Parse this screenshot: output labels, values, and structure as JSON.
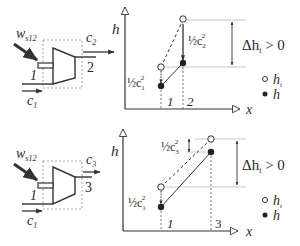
{
  "top": {
    "turbine": {
      "work_label": "w",
      "work_sub": "s12",
      "inlet_label": "1",
      "outlet_label": "2",
      "inlet_velocity": "c",
      "inlet_velocity_sub": "1",
      "outlet_velocity": "c",
      "outlet_velocity_sub": "2"
    },
    "chart": {
      "y_axis_label": "h",
      "x_axis_label": "x",
      "tick_1": "1",
      "tick_2": "2",
      "ke1_label": "½c",
      "ke1_sub": "1",
      "ke1_sup": "2",
      "ke2_label": "½c",
      "ke2_sub": "2",
      "ke2_sup": "2",
      "delta_label": "Δh",
      "delta_sub": "t",
      "delta_cond": " > 0",
      "legend_ht": "h",
      "legend_ht_sub": "t",
      "legend_h": "h"
    }
  },
  "bottom": {
    "turbine": {
      "work_label": "w",
      "work_sub": "s12",
      "inlet_label": "1",
      "outlet_label": "3",
      "inlet_velocity": "c",
      "inlet_velocity_sub": "1",
      "outlet_velocity": "c",
      "outlet_velocity_sub": "3"
    },
    "chart": {
      "y_axis_label": "h",
      "x_axis_label": "x",
      "tick_1": "1",
      "tick_3": "3",
      "ke1_label": "½c",
      "ke1_sub": "1",
      "ke1_sup": "2",
      "ke3_label": "½c",
      "ke3_sub": "3",
      "ke3_sup": "2",
      "delta_label": "Δh",
      "delta_sub": "t",
      "delta_cond": " > 0",
      "legend_ht": "h",
      "legend_ht_sub": "t",
      "legend_h": "h"
    }
  },
  "colors": {
    "stroke": "#333333",
    "guide": "#bbbbbb",
    "text": "#2a2a2a"
  }
}
